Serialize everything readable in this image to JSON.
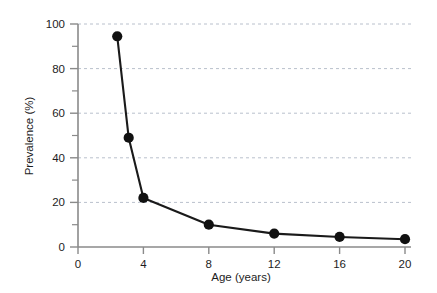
{
  "chart_data": {
    "type": "line",
    "title": "",
    "xlabel": "Age (years)",
    "ylabel": "Prevalence (%)",
    "xlim": [
      0,
      20
    ],
    "ylim": [
      0,
      100
    ],
    "xticks": [
      0,
      4,
      8,
      12,
      16,
      20
    ],
    "yticks": [
      0,
      20,
      40,
      60,
      80,
      100
    ],
    "y_minor_ticks": [
      10,
      30,
      50,
      70,
      90
    ],
    "grid": "horizontal-dashed",
    "legend": "none",
    "marker": "filled-circle",
    "series": [
      {
        "name": "Prevalence",
        "x": [
          2.4,
          3.1,
          4.0,
          8.0,
          12.0,
          16.0,
          20.0
        ],
        "values": [
          94.5,
          49.0,
          22.0,
          10.0,
          6.0,
          4.5,
          3.5
        ]
      }
    ],
    "colors": {
      "line": "#1a1a1a",
      "marker": "#111111",
      "grid": "#b9c0cc",
      "axis": "#8a8a8a",
      "text": "#1d1d1d",
      "background": "#ffffff"
    }
  },
  "axes": {
    "x_tick_labels": [
      "0",
      "4",
      "8",
      "12",
      "16",
      "20"
    ],
    "y_tick_labels": [
      "0",
      "20",
      "40",
      "60",
      "80",
      "100"
    ],
    "x_axis_title": "Age (years)",
    "y_axis_title": "Prevalence (%)"
  }
}
